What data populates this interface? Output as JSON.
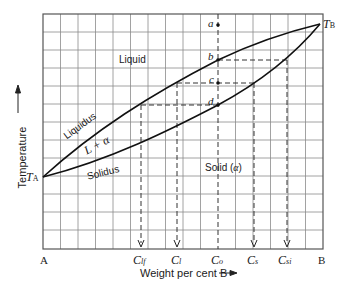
{
  "diagram": {
    "type": "binary isomorphous phase diagram",
    "axes": {
      "y_label": "Temperature",
      "x_label": "Weight per cent B",
      "x_left_label": "A",
      "x_right_label": "B"
    },
    "temperatures": {
      "t_a_main": "T",
      "t_a_sub": "A",
      "t_b_main": "T",
      "t_b_sub": "B"
    },
    "regions": {
      "liquid": "Liquid",
      "two_phase_main": "L + ",
      "two_phase_alpha": "α",
      "solid": "Solid (",
      "solid_alpha": "α",
      "solid_close": ")"
    },
    "curves": {
      "liquidus": "Liquidus",
      "solidus": "Solidus"
    },
    "points": {
      "a": "a",
      "b": "b",
      "c": "c",
      "d": "d"
    },
    "compositions": [
      {
        "main": "C",
        "sub": "lf"
      },
      {
        "main": "C",
        "sub": "l"
      },
      {
        "main": "C",
        "sub": "o"
      },
      {
        "main": "C",
        "sub": "s"
      },
      {
        "main": "C",
        "sub": "si"
      }
    ],
    "colors": {
      "grid": "#7a7a7a",
      "curve": "#111111",
      "dash": "#333333"
    }
  }
}
